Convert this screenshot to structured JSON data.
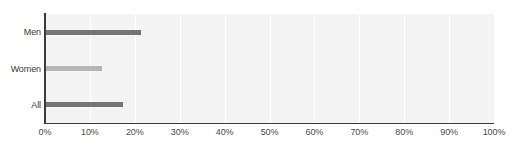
{
  "chart_data": {
    "type": "bar",
    "orientation": "horizontal",
    "title": "",
    "xlabel": "",
    "ylabel": "",
    "categories": [
      "Men",
      "Women",
      "All"
    ],
    "values": [
      21.4,
      12.6,
      17.3
    ],
    "value_suffix": "%",
    "series": [
      {
        "name": "Percent",
        "values": [
          21.4,
          12.6,
          17.3
        ]
      }
    ],
    "bar_colors": [
      "#757575",
      "#b6b6b6",
      "#757575"
    ],
    "xlim": [
      0,
      100
    ],
    "xticks": [
      0,
      10,
      20,
      30,
      40,
      50,
      60,
      70,
      80,
      90,
      100
    ],
    "xtick_labels": [
      "0%",
      "10%",
      "20%",
      "30%",
      "40%",
      "50%",
      "60%",
      "70%",
      "80%",
      "90%",
      "100%"
    ],
    "grid": "vertical",
    "gridline_color": "#ffffff",
    "plot_background": "#f4f4f5",
    "axis_color": "#3a3a3a",
    "legend": null,
    "legend_position": "none"
  },
  "colors": {
    "page_background": "#ffffff",
    "plot_background": "#f4f4f5",
    "gridline": "#ffffff",
    "axis": "#3a3a3a",
    "bar_dark": "#757575",
    "bar_light": "#b6b6b6",
    "tick_text": "#4a4a4a",
    "category_text": "#3a3a3a"
  },
  "clipped_title": ""
}
